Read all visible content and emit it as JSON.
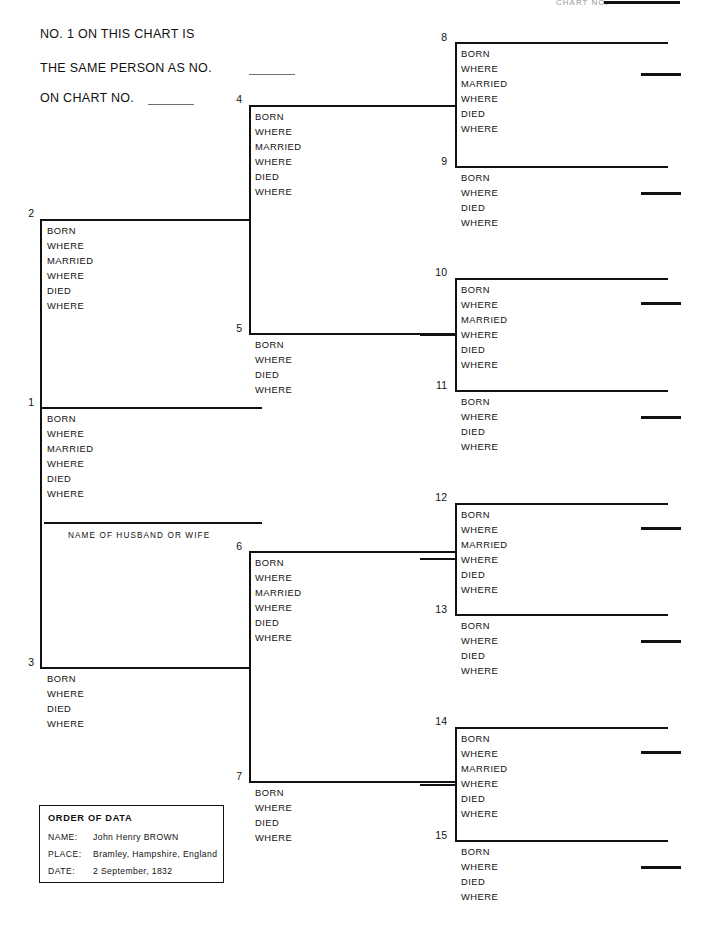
{
  "header": {
    "line1": "NO. 1 ON THIS CHART IS",
    "line2": "THE SAME PERSON AS NO.",
    "line3": "ON CHART NO.",
    "corner_note": "CHART NO."
  },
  "labels": {
    "born": "BORN",
    "where": "WHERE",
    "married": "MARRIED",
    "died": "DIED",
    "husband_or_wife": "NAME OF HUSBAND OR WIFE"
  },
  "legend": {
    "title": "ORDER OF DATA",
    "rows": [
      {
        "key": "NAME:",
        "value": "John Henry BROWN"
      },
      {
        "key": "PLACE:",
        "value": "Bramley, Hampshire, England"
      },
      {
        "key": "DATE:",
        "value": "2 September, 1832"
      }
    ]
  },
  "boxes": [
    {
      "number": "1",
      "type": "married",
      "fields": [
        "BORN",
        "WHERE",
        "MARRIED",
        "WHERE",
        "DIED",
        "WHERE"
      ]
    },
    {
      "number": "2",
      "type": "married",
      "fields": [
        "BORN",
        "WHERE",
        "MARRIED",
        "WHERE",
        "DIED",
        "WHERE"
      ]
    },
    {
      "number": "3",
      "type": "plain",
      "fields": [
        "BORN",
        "WHERE",
        "DIED",
        "WHERE"
      ]
    },
    {
      "number": "4",
      "type": "married",
      "fields": [
        "BORN",
        "WHERE",
        "MARRIED",
        "WHERE",
        "DIED",
        "WHERE"
      ]
    },
    {
      "number": "5",
      "type": "plain",
      "fields": [
        "BORN",
        "WHERE",
        "DIED",
        "WHERE"
      ]
    },
    {
      "number": "6",
      "type": "married",
      "fields": [
        "BORN",
        "WHERE",
        "MARRIED",
        "WHERE",
        "DIED",
        "WHERE"
      ]
    },
    {
      "number": "7",
      "type": "plain",
      "fields": [
        "BORN",
        "WHERE",
        "DIED",
        "WHERE"
      ]
    },
    {
      "number": "8",
      "type": "married",
      "fields": [
        "BORN",
        "WHERE",
        "MARRIED",
        "WHERE",
        "DIED",
        "WHERE"
      ]
    },
    {
      "number": "9",
      "type": "plain",
      "fields": [
        "BORN",
        "WHERE",
        "DIED",
        "WHERE"
      ]
    },
    {
      "number": "10",
      "type": "married",
      "fields": [
        "BORN",
        "WHERE",
        "MARRIED",
        "WHERE",
        "DIED",
        "WHERE"
      ]
    },
    {
      "number": "11",
      "type": "plain",
      "fields": [
        "BORN",
        "WHERE",
        "DIED",
        "WHERE"
      ]
    },
    {
      "number": "12",
      "type": "married",
      "fields": [
        "BORN",
        "WHERE",
        "MARRIED",
        "WHERE",
        "DIED",
        "WHERE"
      ]
    },
    {
      "number": "13",
      "type": "plain",
      "fields": [
        "BORN",
        "WHERE",
        "DIED",
        "WHERE"
      ]
    },
    {
      "number": "14",
      "type": "married",
      "fields": [
        "BORN",
        "WHERE",
        "MARRIED",
        "WHERE",
        "DIED",
        "WHERE"
      ]
    },
    {
      "number": "15",
      "type": "plain",
      "fields": [
        "BORN",
        "WHERE",
        "DIED",
        "WHERE"
      ]
    }
  ]
}
